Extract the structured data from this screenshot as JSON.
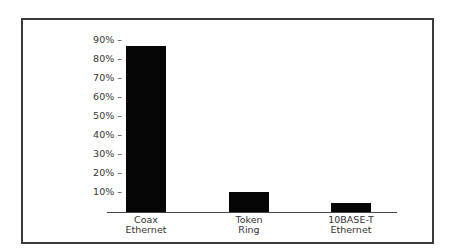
{
  "chart_data": {
    "type": "bar",
    "title": "",
    "xlabel": "",
    "ylabel": "",
    "categories": [
      "Coax Ethernet",
      "Token Ring",
      "10BASE-T Ethernet"
    ],
    "category_lines": [
      [
        "Coax",
        "Ethernet"
      ],
      [
        "Token",
        "Ring"
      ],
      [
        "10BASE-T",
        "Ethernet"
      ]
    ],
    "values": [
      87,
      10,
      4
    ],
    "unit": "%",
    "ylim": [
      0,
      90
    ],
    "yticks": [
      "90% –",
      "80% –",
      "70% –",
      "60% –",
      "50% –",
      "40% –",
      "30% –",
      "20% –",
      "10% –"
    ],
    "ytick_values": [
      90,
      80,
      70,
      60,
      50,
      40,
      30,
      20,
      10
    ],
    "grid": false,
    "legend": null,
    "bar_color": "#050505",
    "frame_color": "#3a3a3a"
  }
}
